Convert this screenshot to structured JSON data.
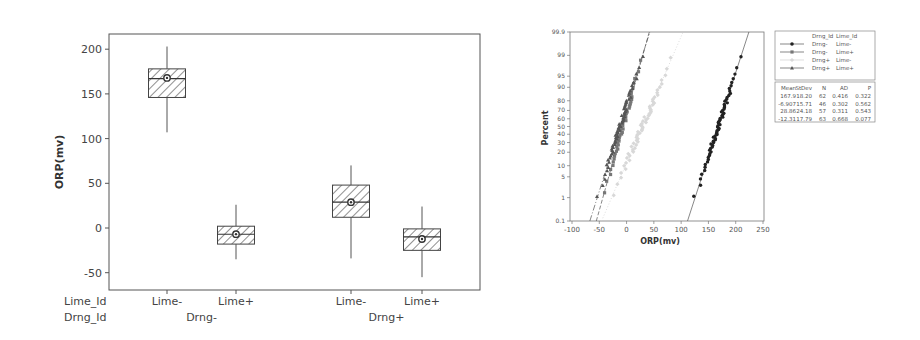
{
  "chart_data": [
    {
      "type": "box",
      "title": "",
      "xlabel": "",
      "ylabel": "ORP(mv)",
      "ylim": [
        -60,
        220
      ],
      "yticks": [
        200,
        150,
        100,
        50,
        0,
        -50
      ],
      "grid": false,
      "x_factor_labels": {
        "row1": "Lime_Id",
        "row2": "Drng_Id"
      },
      "groups": [
        {
          "lime": "Lime-",
          "drng": "Drng-",
          "whisker_low": 107,
          "q1": 146,
          "median": 167,
          "q3": 178,
          "whisker_high": 203,
          "mean": 167.9
        },
        {
          "lime": "Lime+",
          "drng": "Drng-",
          "whisker_low": -35,
          "q1": -18,
          "median": -7,
          "q3": 2,
          "whisker_high": 26,
          "mean": -6.907
        },
        {
          "lime": "Lime-",
          "drng": "Drng+",
          "whisker_low": -34,
          "q1": 12,
          "median": 29,
          "q3": 48,
          "whisker_high": 70,
          "mean": 28.86
        },
        {
          "lime": "Lime+",
          "drng": "Drng+",
          "whisker_low": -55,
          "q1": -25,
          "median": -10,
          "q3": -1,
          "whisker_high": 24,
          "mean": -12.31
        }
      ],
      "group_labels": [
        "Drng-",
        "Drng+"
      ]
    },
    {
      "type": "scatter",
      "subtype": "normal-probability-plot",
      "title": "",
      "xlabel": "ORP(mv)",
      "ylabel": "Percent",
      "xlim": [
        -100,
        250
      ],
      "xticks": [
        -100,
        -50,
        0,
        50,
        100,
        150,
        200,
        250
      ],
      "yticks": [
        "0.1",
        "1",
        "5",
        "10",
        "20",
        "30",
        "40",
        "50",
        "60",
        "70",
        "80",
        "90",
        "95",
        "99",
        "99.9"
      ],
      "legend": {
        "position": "right",
        "header": [
          "Drng_Id",
          "Lime_Id"
        ],
        "entries": [
          {
            "drng": "Drng-",
            "lime": "Lime-",
            "marker": "circle",
            "color": "#222222"
          },
          {
            "drng": "Drng-",
            "lime": "Lime+",
            "marker": "square",
            "color": "#777777"
          },
          {
            "drng": "Drng+",
            "lime": "Lime-",
            "marker": "diamond",
            "color": "#d8d8d8"
          },
          {
            "drng": "Drng+",
            "lime": "Lime+",
            "marker": "triangle",
            "color": "#555555"
          }
        ]
      },
      "stats_table": {
        "columns": [
          "Mean",
          "StDev",
          "N",
          "AD",
          "P"
        ],
        "rows": [
          [
            "167.9",
            "18.20",
            "62",
            "0.416",
            "0.322"
          ],
          [
            "-6.907",
            "15.71",
            "46",
            "0.302",
            "0.562"
          ],
          [
            "28.86",
            "24.18",
            "57",
            "0.311",
            "0.543"
          ],
          [
            "-12.31",
            "17.79",
            "63",
            "0.668",
            "0.077"
          ]
        ]
      },
      "series": [
        {
          "name": "Drng- Lime-",
          "mean": 167.9,
          "stdev": 18.2,
          "n": 62
        },
        {
          "name": "Drng- Lime+",
          "mean": -6.907,
          "stdev": 15.71,
          "n": 46
        },
        {
          "name": "Drng+ Lime-",
          "mean": 28.86,
          "stdev": 24.18,
          "n": 57
        },
        {
          "name": "Drng+ Lime+",
          "mean": -12.31,
          "stdev": 17.79,
          "n": 63
        }
      ]
    }
  ]
}
